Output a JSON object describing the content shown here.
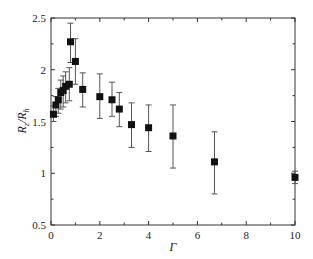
{
  "chart_data": {
    "type": "scatter",
    "title": "",
    "xlabel": "Γ",
    "ylabel": "R_z/R_h",
    "xlim": [
      0,
      10
    ],
    "ylim": [
      0.5,
      2.5
    ],
    "xticks": [
      0,
      2,
      4,
      6,
      8,
      10
    ],
    "yticks": [
      0.5,
      1,
      1.5,
      2,
      2.5
    ],
    "grid": false,
    "legend": null,
    "marker": "square",
    "error_bars": true,
    "series": [
      {
        "name": "R_z/R_h",
        "points": [
          {
            "x": 0.1,
            "y": 1.57,
            "ylo": 1.5,
            "yhi": 1.65
          },
          {
            "x": 0.2,
            "y": 1.66,
            "ylo": 1.55,
            "yhi": 1.74
          },
          {
            "x": 0.3,
            "y": 1.71,
            "ylo": 1.58,
            "yhi": 1.82
          },
          {
            "x": 0.4,
            "y": 1.78,
            "ylo": 1.62,
            "yhi": 1.9
          },
          {
            "x": 0.5,
            "y": 1.8,
            "ylo": 1.64,
            "yhi": 1.94
          },
          {
            "x": 0.6,
            "y": 1.84,
            "ylo": 1.68,
            "yhi": 1.98
          },
          {
            "x": 0.75,
            "y": 1.86,
            "ylo": 1.7,
            "yhi": 2.02
          },
          {
            "x": 0.8,
            "y": 2.27,
            "ylo": 2.07,
            "yhi": 2.45
          },
          {
            "x": 1.0,
            "y": 2.08,
            "ylo": 1.86,
            "yhi": 2.3
          },
          {
            "x": 1.3,
            "y": 1.81,
            "ylo": 1.64,
            "yhi": 1.97
          },
          {
            "x": 2.0,
            "y": 1.74,
            "ylo": 1.53,
            "yhi": 1.96
          },
          {
            "x": 2.5,
            "y": 1.71,
            "ylo": 1.55,
            "yhi": 1.88
          },
          {
            "x": 2.8,
            "y": 1.62,
            "ylo": 1.45,
            "yhi": 1.78
          },
          {
            "x": 3.3,
            "y": 1.47,
            "ylo": 1.25,
            "yhi": 1.68
          },
          {
            "x": 4.0,
            "y": 1.44,
            "ylo": 1.21,
            "yhi": 1.66
          },
          {
            "x": 5.0,
            "y": 1.36,
            "ylo": 1.05,
            "yhi": 1.66
          },
          {
            "x": 6.7,
            "y": 1.11,
            "ylo": 0.8,
            "yhi": 1.4
          },
          {
            "x": 10.0,
            "y": 0.96,
            "ylo": 0.9,
            "yhi": 1.02
          }
        ]
      }
    ]
  },
  "colors": {
    "axis": "#333333",
    "marker": "#111111",
    "errorbar": "#555555"
  }
}
